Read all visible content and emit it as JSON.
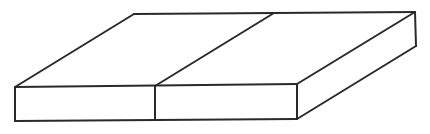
{
  "diagram": {
    "type": "isometric-line-drawing",
    "stroke_color": "#2a2a2a",
    "background_color": "#ffffff",
    "vertices": {
      "front_left_top": [
        15,
        87
      ],
      "front_left_bottom": [
        15,
        121
      ],
      "front_divider_top": [
        155,
        86
      ],
      "front_divider_bottom": [
        155,
        120
      ],
      "front_right_top": [
        297,
        84
      ],
      "front_right_bottom": [
        297,
        119
      ],
      "back_left_top": [
        134,
        14
      ],
      "back_divider_top": [
        274,
        13
      ],
      "back_right_top": [
        415,
        12
      ],
      "back_right_bottom": [
        416,
        46
      ]
    },
    "parts": [
      {
        "name": "left-block"
      },
      {
        "name": "right-block"
      }
    ]
  }
}
